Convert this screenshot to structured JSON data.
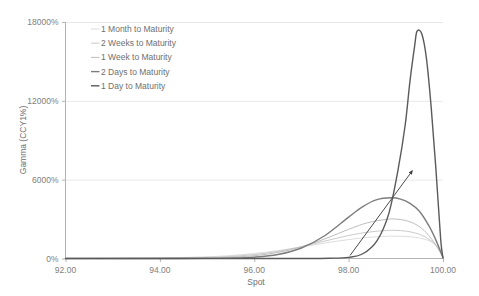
{
  "chart_data": {
    "type": "line",
    "title": "",
    "xlabel": "Spot",
    "ylabel": "Gamma (CCY1%)",
    "xlim": [
      92.0,
      100.0
    ],
    "ylim": [
      0,
      18000
    ],
    "x_ticks": [
      "92.00",
      "94.00",
      "96.00",
      "98.00",
      "100.00"
    ],
    "x_tick_values": [
      92.0,
      94.0,
      96.0,
      98.0,
      100.0
    ],
    "y_ticks": [
      "0%",
      "6000%",
      "12000%",
      "18000%"
    ],
    "y_tick_values": [
      0,
      6000,
      12000,
      18000
    ],
    "grid": "horizontal",
    "legend_position": "upper-left-inside",
    "series": [
      {
        "name": "1 Month to Maturity",
        "color": "#d9d9d9",
        "width": 0.9,
        "x": [
          92.0,
          93.0,
          94.0,
          95.0,
          95.5,
          96.0,
          96.5,
          97.0,
          97.5,
          98.0,
          98.4,
          98.8,
          99.0,
          99.2,
          99.4,
          99.6,
          99.8,
          100.0
        ],
        "values": [
          5,
          15,
          45,
          130,
          230,
          380,
          600,
          880,
          1180,
          1440,
          1600,
          1690,
          1700,
          1680,
          1620,
          1480,
          1180,
          520
        ]
      },
      {
        "name": "2 Weeks to Maturity",
        "color": "#c4c4c4",
        "width": 0.9,
        "x": [
          92.0,
          93.0,
          94.0,
          95.0,
          95.5,
          96.0,
          96.5,
          97.0,
          97.5,
          98.0,
          98.4,
          98.8,
          99.0,
          99.2,
          99.4,
          99.6,
          99.8,
          100.0
        ],
        "values": [
          2,
          6,
          22,
          85,
          160,
          300,
          540,
          900,
          1330,
          1750,
          2000,
          2130,
          2140,
          2090,
          1950,
          1680,
          1180,
          330
        ]
      },
      {
        "name": "1 Week to Maturity",
        "color": "#bdbdbd",
        "width": 1.0,
        "x": [
          92.0,
          93.0,
          94.0,
          95.0,
          95.5,
          96.0,
          96.5,
          97.0,
          97.5,
          98.0,
          98.4,
          98.8,
          99.0,
          99.2,
          99.4,
          99.6,
          99.8,
          100.0
        ],
        "values": [
          0,
          2,
          8,
          45,
          100,
          215,
          460,
          880,
          1500,
          2220,
          2720,
          2980,
          3000,
          2900,
          2640,
          2130,
          1280,
          120
        ]
      },
      {
        "name": "2 Days to Maturity",
        "color": "#7d7d7d",
        "width": 1.4,
        "x": [
          92.0,
          93.0,
          94.0,
          95.0,
          95.5,
          96.0,
          96.5,
          97.0,
          97.5,
          98.0,
          98.3,
          98.6,
          98.9,
          99.1,
          99.3,
          99.5,
          99.7,
          99.85,
          100.0
        ],
        "values": [
          0,
          0,
          1,
          10,
          32,
          100,
          300,
          800,
          1750,
          3150,
          3950,
          4480,
          4620,
          4520,
          4200,
          3600,
          2500,
          1400,
          60
        ]
      },
      {
        "name": "1 Day to Maturity",
        "color": "#5a5a5a",
        "width": 1.4,
        "x": [
          92.0,
          94.0,
          96.0,
          97.0,
          97.6,
          98.0,
          98.3,
          98.6,
          98.85,
          99.05,
          99.2,
          99.3,
          99.4,
          99.45,
          99.55,
          99.65,
          99.75,
          99.85,
          99.95,
          100.0
        ],
        "values": [
          0,
          0,
          0,
          2,
          20,
          90,
          360,
          1350,
          3400,
          6800,
          10200,
          13500,
          16200,
          17300,
          17100,
          15200,
          11500,
          6800,
          1500,
          40
        ]
      }
    ],
    "annotations": [
      {
        "type": "arrow",
        "from": [
          98.03,
          230
        ],
        "to": [
          99.35,
          6680
        ]
      }
    ]
  }
}
